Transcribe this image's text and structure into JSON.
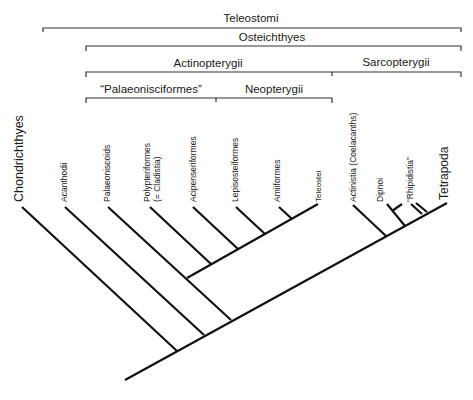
{
  "brackets": {
    "teleostomi": "Teleostomi",
    "osteichthyes": "Osteichthyes",
    "actinopterygii": "Actinopterygii",
    "sarcopterygii": "Sarcopterygii",
    "palaeonisciformes": "“Palaeonisciformes”",
    "neopterygii": "Neopterygii"
  },
  "taxa": {
    "chondrichthyes": "Chondrichthyes",
    "acanthodii": "Acanthodii",
    "palaeoniscoids": "Palaeoniscoids",
    "polypteriformes_1": "Polypteriformes",
    "polypteriformes_2": "(= Cladistia)",
    "acipenseriformes": "Acipenseriformes",
    "lepisosteiformes": "Lepisosteiformes",
    "amiiformes": "Amiiformes",
    "teleostei": "Teleostei",
    "actinistia": "Actinistia (Coelacanths)",
    "dipnoi": "Dipnoi",
    "rhipidistia": "“Rhipidistia”",
    "tetrapoda": "Tetrapoda"
  },
  "colors": {
    "line": "#111111",
    "bracket": "#333333"
  }
}
